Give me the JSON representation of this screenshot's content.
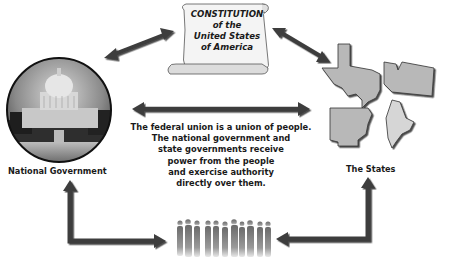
{
  "constitution": {
    "lines": [
      "CONSTITUTION",
      "of the",
      "United States",
      "of America"
    ]
  },
  "national_government": {
    "label": "National Government",
    "image": "us-capitol-building-photo"
  },
  "states": {
    "label": "The States",
    "shapes": [
      "texas",
      "washington",
      "arkansas",
      "maine"
    ]
  },
  "center_text": {
    "lines": [
      "The federal union is a union of people.",
      "The national government and",
      "state governments receive",
      "power from the people",
      "and exercise authority",
      "directly over them."
    ]
  },
  "people": {
    "image": "crowd-of-people-silhouettes"
  },
  "colors": {
    "arrow": "#3d3d3d",
    "state_fill": "#b8b8b8",
    "maine_fill": "#d6d6d6",
    "scroll_fill": "#f4f4f4",
    "text": "#1a1a1a"
  }
}
